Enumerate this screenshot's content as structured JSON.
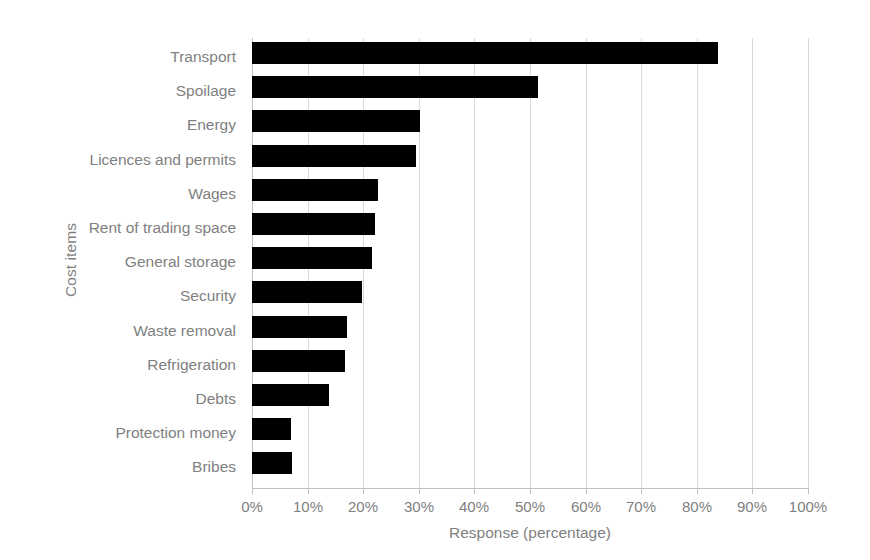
{
  "chart_data": {
    "type": "bar",
    "orientation": "horizontal",
    "title": "",
    "xlabel": "Response (percentage)",
    "ylabel": "Cost items",
    "xlim": [
      0,
      100
    ],
    "xticks": [
      "0%",
      "10%",
      "20%",
      "30%",
      "40%",
      "50%",
      "60%",
      "70%",
      "80%",
      "90%",
      "100%"
    ],
    "xtick_values": [
      0,
      10,
      20,
      30,
      40,
      50,
      60,
      70,
      80,
      90,
      100
    ],
    "grid": "vertical",
    "legend": "none",
    "bar_color": "#000000",
    "text_color": "#7f7f7f",
    "gridline_color": "#d9d9d9",
    "categories": [
      "Transport",
      "Spoilage",
      "Energy",
      "Licences and permits",
      "Wages",
      "Rent of trading space",
      "General storage",
      "Security",
      "Waste removal",
      "Refrigeration",
      "Debts",
      "Protection money",
      "Bribes"
    ],
    "values": [
      83.8,
      51.4,
      30.2,
      29.5,
      22.7,
      22.1,
      21.6,
      19.8,
      17.1,
      16.7,
      13.8,
      7.0,
      7.2
    ]
  }
}
